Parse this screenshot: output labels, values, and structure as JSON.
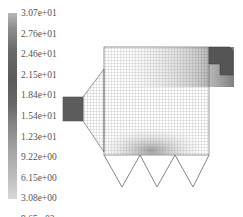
{
  "legend": {
    "labels": [
      "3.07e+01",
      "2.76e+01",
      "2.46e+01",
      "2.15e+01",
      "1.84e+01",
      "1.54e+01",
      "1.23e+01",
      "9.22e+00",
      "6.15e+00",
      "3.08e+00",
      "9.65e-03"
    ],
    "max": 30.7,
    "min": 0.00965
  },
  "figure": {
    "type": "velocity-vector-field",
    "hoppers": 3,
    "colors": {
      "outline": "#555555",
      "dense": "#3a3a3a",
      "mid": "#9a9a9a",
      "light": "#d6d6d6"
    }
  }
}
